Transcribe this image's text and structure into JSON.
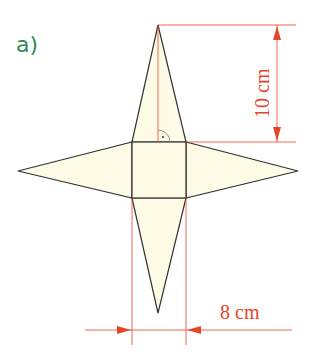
{
  "figure": {
    "label": "a)",
    "colors": {
      "label": "#2e8b57",
      "fill": "#fdfbe6",
      "outline": "#333333",
      "dimension": "#e8442a"
    }
  },
  "dimensions": {
    "height": {
      "value": 10,
      "unit": "cm",
      "text": "10 cm"
    },
    "base": {
      "value": 8,
      "unit": "cm",
      "text": "8 cm"
    }
  },
  "markers": {
    "right_angle": "right-angle marker at base of triangle height"
  }
}
